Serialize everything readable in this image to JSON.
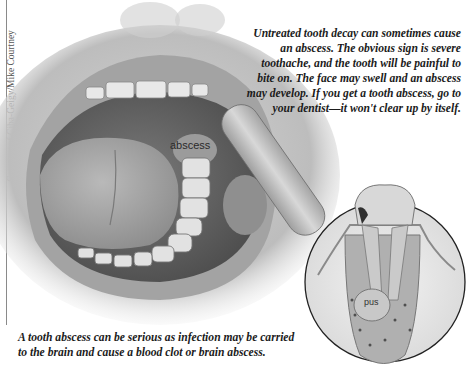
{
  "credit": "Courtesy of Ciba-Geigy/Mike Courtney",
  "captions": {
    "top": "Untreated tooth decay can sometimes cause an abscess. The obvious sign is severe toothache, and the tooth will be painful to bite on. The face may swell and an abscess may develop. If you get a tooth abscess, go to your dentist—it won't clear up by itself.",
    "bottom": "A tooth abscess can be serious as infection may be carried to the brain and cause a blood clot or brain abscess."
  },
  "illustration": {
    "main": "open-mouth-with-tongue-depressor",
    "inset": "tooth-cross-section",
    "labels": {
      "abscess": "abscess",
      "pus": "pus"
    }
  },
  "colors": {
    "text": "#1b1b1b",
    "lip": "#9c9c9c",
    "mouth_dark": "#5a5a5a",
    "tongue": "#a8a8a8",
    "teeth": "#e6e6e6",
    "depressor": "#c9c9c9"
  }
}
